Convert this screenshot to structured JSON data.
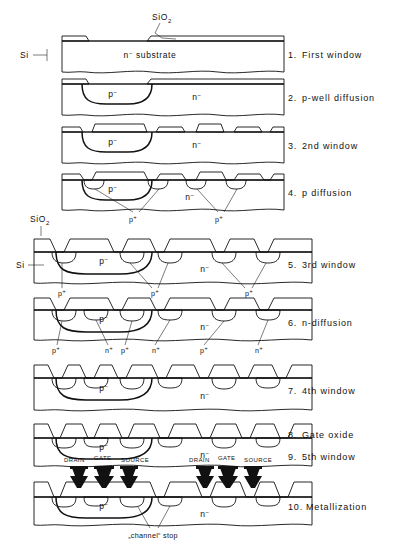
{
  "figure": {
    "material_labels": {
      "oxide": "SiO",
      "oxide_sub": "2",
      "silicon": "Si",
      "substrate": "n⁻ substrate",
      "n_minus": "n⁻",
      "p_minus": "p⁻",
      "p_plus": "p⁺",
      "n_plus": "n⁺"
    },
    "top_annotations": {
      "oxide_top": "SiO",
      "oxide_top_sub": "2",
      "silicon_left": "Si"
    },
    "mid_annotations": {
      "oxide_mid": "SiO",
      "oxide_mid_sub": "2",
      "silicon_left": "Si"
    },
    "bottom_annotation": "„channel“ stop",
    "steps": [
      {
        "number": "1.",
        "label": "First window"
      },
      {
        "number": "2.",
        "label": "p-well diffusion"
      },
      {
        "number": "3.",
        "label": "2nd window"
      },
      {
        "number": "4.",
        "label": "p diffusion"
      },
      {
        "number": "5.",
        "label": "3rd window"
      },
      {
        "number": "6.",
        "label": "n-diffusion"
      },
      {
        "number": "7.",
        "label": "4th window"
      },
      {
        "number": "8.",
        "label": "Gate oxide"
      },
      {
        "number": "9.",
        "label": "5th window"
      },
      {
        "number": "10.",
        "label": "Metallization"
      }
    ],
    "terminal_labels": [
      "DRAIN",
      "GATE",
      "SOURCE",
      "DRAIN",
      "GATE",
      "SOURCE"
    ],
    "region_labels_step1": [
      "n⁻ substrate"
    ],
    "region_labels_step2": [
      "p⁻",
      "n⁻"
    ],
    "region_labels_step3": [
      "p⁻",
      "n⁻"
    ],
    "region_labels_step4": [
      "p⁻",
      "n⁻",
      "p⁺",
      "p⁺"
    ],
    "region_labels_step5": [
      "p⁻",
      "n⁻",
      "p⁺",
      "p⁺",
      "p⁺"
    ],
    "region_labels_step6": [
      "p⁻",
      "n⁻",
      "p⁺",
      "n⁺",
      "p⁺",
      "n⁺",
      "p⁺",
      "n⁺"
    ],
    "region_labels_step7": [
      "p⁻",
      "n⁻"
    ],
    "region_labels_step89": [
      "p⁻",
      "n⁻"
    ],
    "region_labels_step10": [
      "p⁻",
      "n⁻"
    ],
    "colors": {
      "ink": "#111111",
      "paper": "#ffffff",
      "oxide_stipple": "#111111",
      "metal": "#111111"
    }
  }
}
